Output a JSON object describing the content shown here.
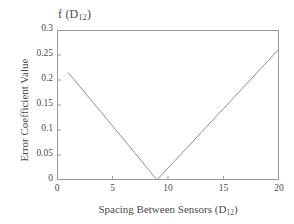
{
  "chart_data": {
    "type": "line",
    "title": "f (D12)",
    "title_base": "f (D",
    "title_sub": "12",
    "title_tail": ")",
    "xlabel_base": "Spacing Between Sensors (D",
    "xlabel_sub": "12",
    "xlabel_tail": ")",
    "xlabel": "Spacing Between Sensors (D12)",
    "ylabel": "Error Coefficient Value",
    "xlim": [
      0,
      20
    ],
    "ylim": [
      0,
      0.3
    ],
    "xticks": [
      0,
      5,
      10,
      15,
      20
    ],
    "xtick_labels": [
      "0",
      "5",
      "10",
      "15",
      "20"
    ],
    "yticks": [
      0,
      0.05,
      0.1,
      0.15,
      0.2,
      0.25,
      0.3
    ],
    "ytick_labels": [
      "0",
      "0.05",
      "0.1",
      "0.15",
      "0.2",
      "0.25",
      "0.3"
    ],
    "grid": false,
    "legend": null,
    "line_color": "#8c8c8c",
    "line_width": 1,
    "series": [
      {
        "name": "f (D12)",
        "x": [
          1,
          2,
          3,
          4,
          5,
          6,
          7,
          8,
          9,
          10,
          11,
          12,
          13,
          14,
          15,
          16,
          17,
          18,
          19,
          20
        ],
        "y": [
          0.215,
          0.1885,
          0.1615,
          0.135,
          0.108,
          0.0815,
          0.0545,
          0.0275,
          0.0,
          0.0238,
          0.0476,
          0.0714,
          0.0952,
          0.119,
          0.1428,
          0.1667,
          0.1905,
          0.2143,
          0.2381,
          0.262
        ]
      }
    ],
    "annotations": []
  },
  "figure": {
    "background_color": "#ffffff",
    "axes_color": "#9a9a9a",
    "text_color": "#4a4a4a"
  }
}
